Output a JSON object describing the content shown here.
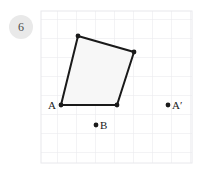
{
  "badge": {
    "number": "6",
    "bg_color": "#e9e9e9",
    "text_color": "#4a4a4a"
  },
  "figure": {
    "title": "",
    "grid": {
      "x": 41,
      "y": 11,
      "width": 151,
      "height": 152,
      "cell_size": 19,
      "line_color": "#e8e8ec",
      "border_color": "#e8e8ec",
      "visible": true
    },
    "shape": {
      "name": "quadrilateral",
      "fill_color": "#f7f7f7",
      "stroke_color": "#1a1a1a",
      "stroke_width": 2,
      "points": "78,36 134,52 117,105 61,105",
      "vertices": [
        {
          "name": "top-left-vertex",
          "x": 78,
          "y": 36
        },
        {
          "name": "top-right-vertex",
          "x": 134,
          "y": 52
        },
        {
          "name": "bottom-right-vertex",
          "x": 117,
          "y": 105
        },
        {
          "name": "bottom-left-vertex",
          "x": 61,
          "y": 105
        }
      ]
    },
    "labeled_points": [
      {
        "id": "point-a",
        "label": "A",
        "x": 61,
        "y": 105,
        "label_x": 48,
        "label_y": 109,
        "dot_visible": true,
        "dot_radius": 2.4
      },
      {
        "id": "point-b",
        "label": "B",
        "x": 96,
        "y": 125,
        "label_x": 100,
        "label_y": 129,
        "dot_visible": true,
        "dot_radius": 2.4
      },
      {
        "id": "point-a-prime",
        "label": "A′",
        "x": 168,
        "y": 105,
        "label_x": 172,
        "label_y": 109,
        "dot_visible": true,
        "dot_radius": 2.4
      }
    ],
    "vertex_dots": [
      {
        "name": "vertex-dot-top-left",
        "x": 78,
        "y": 36,
        "r": 2.4
      },
      {
        "name": "vertex-dot-top-right",
        "x": 134,
        "y": 52,
        "r": 2.4
      },
      {
        "name": "vertex-dot-bottom-right",
        "x": 117,
        "y": 105,
        "r": 2.4
      },
      {
        "name": "vertex-dot-bottom-left",
        "x": 61,
        "y": 105,
        "r": 2.4
      }
    ]
  }
}
